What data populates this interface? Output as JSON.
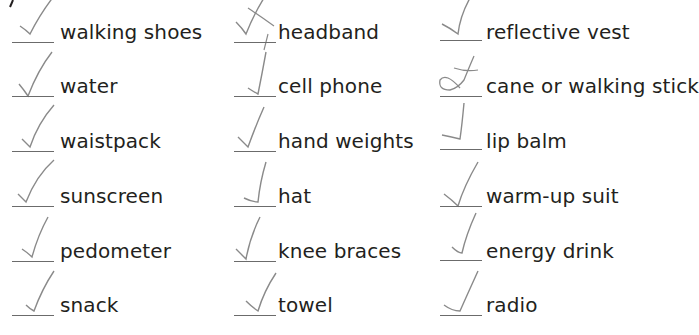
{
  "worksheet": {
    "columns": [
      {
        "items": [
          {
            "label": "walking shoes",
            "mark": "check"
          },
          {
            "label": "water",
            "mark": "check"
          },
          {
            "label": "waistpack",
            "mark": "check"
          },
          {
            "label": "sunscreen",
            "mark": "check"
          },
          {
            "label": "pedometer",
            "mark": "check"
          },
          {
            "label": "snack",
            "mark": "check"
          }
        ]
      },
      {
        "items": [
          {
            "label": "headband",
            "mark": "crossed-check"
          },
          {
            "label": "cell phone",
            "mark": "check"
          },
          {
            "label": "hand weights",
            "mark": "check"
          },
          {
            "label": "hat",
            "mark": "check"
          },
          {
            "label": "knee braces",
            "mark": "check"
          },
          {
            "label": "towel",
            "mark": "check"
          }
        ]
      },
      {
        "items": [
          {
            "label": "reflective vest",
            "mark": "check"
          },
          {
            "label": "cane or walking stick",
            "mark": "crossed-loop-check"
          },
          {
            "label": "lip balm",
            "mark": "check"
          },
          {
            "label": "warm-up suit",
            "mark": "check"
          },
          {
            "label": "energy drink",
            "mark": "check"
          },
          {
            "label": "radio",
            "mark": "check"
          }
        ]
      }
    ],
    "colors": {
      "text": "#231f20",
      "pencil_mark": "#8a8a8a",
      "underline": "#6b6b6b"
    }
  }
}
